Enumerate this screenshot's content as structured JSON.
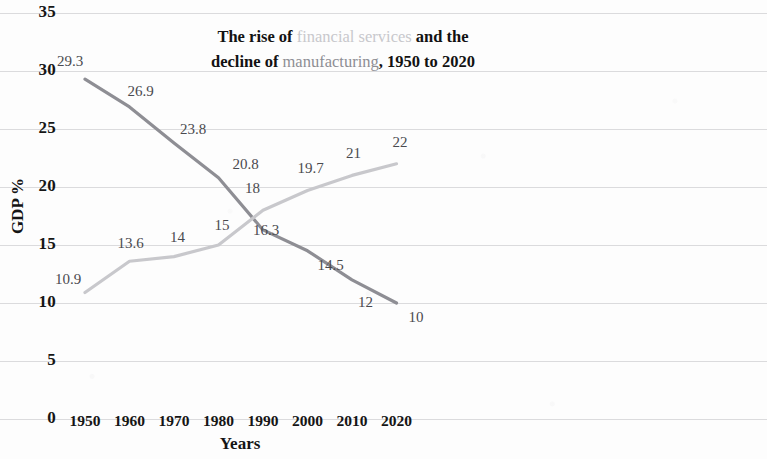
{
  "chart_data": {
    "type": "line",
    "title": "The rise of financial services and the decline of manufacturing, 1950 to 2020",
    "title_parts": {
      "seg1": "The rise of ",
      "rise_word": "financial services",
      "seg2": " and the",
      "seg3": "decline of ",
      "decline_word": "manufacturing",
      "seg4": ", 1950 to 2020"
    },
    "xlabel": "Years",
    "ylabel": "GDP %",
    "categories": [
      "1950",
      "1960",
      "1970",
      "1980",
      "1990",
      "2000",
      "2010",
      "2020"
    ],
    "x": [
      1950,
      1960,
      1970,
      1980,
      1990,
      2000,
      2010,
      2020
    ],
    "ylim": [
      0,
      35
    ],
    "ytick_labels": [
      "35",
      "30",
      "25",
      "20",
      "15",
      "10",
      "5",
      "0"
    ],
    "ytick_values": [
      35,
      30,
      25,
      20,
      15,
      10,
      5,
      0
    ],
    "grid": true,
    "legend": "none",
    "series": [
      {
        "name": "manufacturing",
        "color": "#8e8e94",
        "values": [
          29.3,
          26.9,
          23.8,
          20.8,
          16.3,
          14.5,
          12,
          10
        ],
        "labels": [
          "29.3",
          "26.9",
          "23.8",
          "20.8",
          "16.3",
          "14.5",
          "12",
          "10"
        ]
      },
      {
        "name": "financial services",
        "color": "#c8c8cc",
        "values": [
          10.9,
          13.6,
          14,
          15,
          18,
          19.7,
          21,
          22
        ],
        "labels": [
          "10.9",
          "13.6",
          "14",
          "15",
          "18",
          "19.7",
          "21",
          "22"
        ]
      }
    ]
  }
}
